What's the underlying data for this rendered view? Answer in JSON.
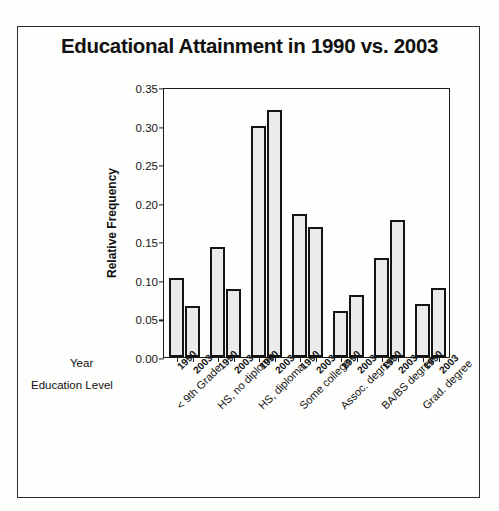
{
  "chart_data": {
    "type": "bar",
    "title": "Educational Attainment in 1990 vs. 2003",
    "xlabel": "Education Level",
    "ylabel": "Relative Frequency",
    "ylim": [
      0.0,
      0.35
    ],
    "ytick_labels": [
      "0.00",
      "0.05",
      "0.10",
      "0.15",
      "0.20",
      "0.25",
      "0.30",
      "0.35"
    ],
    "ytick_values": [
      0.0,
      0.05,
      0.1,
      0.15,
      0.2,
      0.25,
      0.3,
      0.35
    ],
    "grid": false,
    "legend": "none",
    "group_label": "Year",
    "group_values": [
      "1990",
      "2003"
    ],
    "categories": [
      "< 9th Grade",
      "HS, no diploma",
      "HS, diploma",
      "Some college",
      "Assoc. degree",
      "BA/BS degree",
      "Grad. degree"
    ],
    "series": [
      {
        "name": "1990",
        "values": [
          0.103,
          0.143,
          0.3,
          0.186,
          0.06,
          0.128,
          0.069
        ]
      },
      {
        "name": "2003",
        "values": [
          0.066,
          0.088,
          0.32,
          0.168,
          0.08,
          0.178,
          0.09
        ]
      }
    ],
    "bar_fill_color": "#ebebeb",
    "bar_edge_color": "#141414",
    "axis_color": "#1a1a1a",
    "background_color": "#fefefc"
  }
}
